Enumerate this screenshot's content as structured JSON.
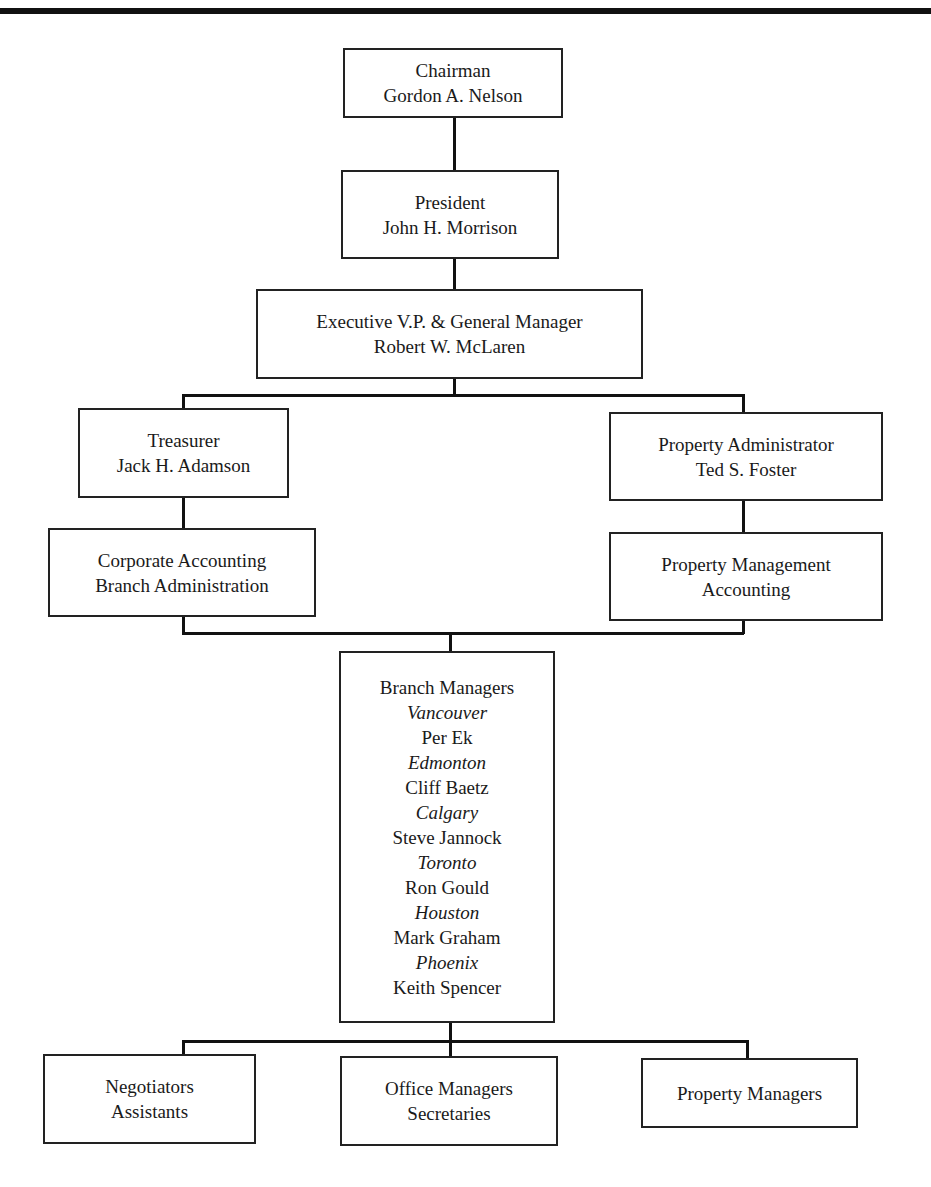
{
  "chart_title": "",
  "nodes": {
    "chairman": {
      "title": "Chairman",
      "name": "Gordon A. Nelson"
    },
    "president": {
      "title": "President",
      "name": "John H. Morrison"
    },
    "evp": {
      "title": "Executive V.P. & General Manager",
      "name": "Robert W. McLaren"
    },
    "treasurer": {
      "title": "Treasurer",
      "name": "Jack H. Adamson"
    },
    "property_admin": {
      "title": "Property Administrator",
      "name": "Ted S. Foster"
    },
    "corporate_accounting": {
      "line1": "Corporate Accounting",
      "line2": "Branch Administration"
    },
    "property_mgmt_accounting": {
      "line1": "Property Management",
      "line2": "Accounting"
    },
    "branch_managers": {
      "title": "Branch Managers",
      "branches": [
        {
          "city": "Vancouver",
          "manager": "Per Ek"
        },
        {
          "city": "Edmonton",
          "manager": "Cliff Baetz"
        },
        {
          "city": "Calgary",
          "manager": "Steve Jannock"
        },
        {
          "city": "Toronto",
          "manager": "Ron Gould"
        },
        {
          "city": "Houston",
          "manager": "Mark Graham"
        },
        {
          "city": "Phoenix",
          "manager": "Keith Spencer"
        }
      ]
    },
    "negotiators": {
      "line1": "Negotiators",
      "line2": "Assistants"
    },
    "office_managers": {
      "line1": "Office Managers",
      "line2": "Secretaries"
    },
    "property_managers": {
      "line1": "Property Managers"
    }
  }
}
